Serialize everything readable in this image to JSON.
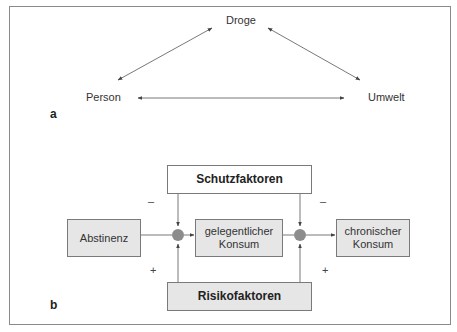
{
  "panel_a": {
    "label": "a",
    "nodes": {
      "top": "Droge",
      "left": "Person",
      "right": "Umwelt"
    }
  },
  "panel_b": {
    "label": "b",
    "boxes": {
      "protective": "Schutzfaktoren",
      "risk": "Risikofaktoren",
      "abstinence": "Abstinenz",
      "occasional_l1": "gelegentlicher",
      "occasional_l2": "Konsum",
      "chronic_l1": "chronischer",
      "chronic_l2": "Konsum"
    },
    "signs": {
      "protective_left": "–",
      "protective_right": "–",
      "risk_left": "+",
      "risk_right": "+"
    }
  },
  "colors": {
    "box_fill": "#e6e6e6",
    "node_fill": "#8c8c8c",
    "line": "#555555",
    "frame": "#8a8a8a"
  }
}
